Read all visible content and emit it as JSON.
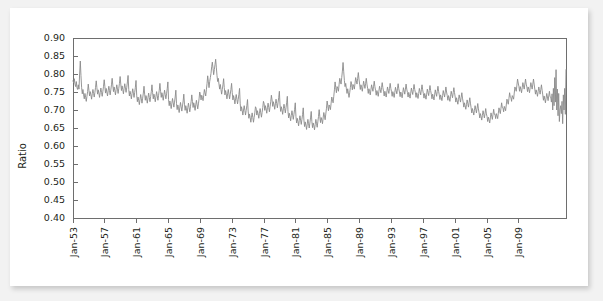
{
  "chart_data": {
    "type": "line",
    "title": "",
    "xlabel": "",
    "ylabel": "Ratio",
    "ylim": [
      0.4,
      0.9
    ],
    "ytick_labels": [
      "0.90",
      "0.85",
      "0.80",
      "0.75",
      "0.70",
      "0.65",
      "0.60",
      "0.55",
      "0.50",
      "0.45",
      "0.40"
    ],
    "ytick_values": [
      0.9,
      0.85,
      0.8,
      0.75,
      0.7,
      0.65,
      0.6,
      0.55,
      0.5,
      0.45,
      0.4
    ],
    "xtick_labels": [
      "Jan-53",
      "Jan-57",
      "Jan-61",
      "Jan-65",
      "Jan-69",
      "Jan-73",
      "Jan-77",
      "Jan-81",
      "Jan-85",
      "Jan-89",
      "Jan-93",
      "Jan-97",
      "Jan-01",
      "Jan-05",
      "Jan-09"
    ],
    "xtick_index": [
      0,
      48,
      96,
      144,
      192,
      240,
      288,
      336,
      384,
      432,
      480,
      528,
      576,
      624,
      672
    ],
    "x_start_label": "Jan-53",
    "x_end_label": "Jan-09",
    "grid": false,
    "legend": false,
    "series_name": "Ratio",
    "line_color": "#8a8a8a",
    "frame_color": "#6e6e6e",
    "background_color": "#ffffff",
    "page_background_color": "#f2f2f2",
    "n_points": 690,
    "values": [
      0.781,
      0.775,
      0.787,
      0.772,
      0.765,
      0.779,
      0.762,
      0.757,
      0.77,
      0.758,
      0.8,
      0.836,
      0.796,
      0.762,
      0.745,
      0.757,
      0.742,
      0.731,
      0.746,
      0.735,
      0.724,
      0.738,
      0.751,
      0.772,
      0.755,
      0.739,
      0.751,
      0.742,
      0.73,
      0.745,
      0.757,
      0.746,
      0.736,
      0.749,
      0.763,
      0.781,
      0.762,
      0.744,
      0.756,
      0.747,
      0.735,
      0.748,
      0.761,
      0.749,
      0.738,
      0.752,
      0.766,
      0.784,
      0.766,
      0.747,
      0.76,
      0.75,
      0.739,
      0.753,
      0.766,
      0.754,
      0.742,
      0.756,
      0.77,
      0.788,
      0.769,
      0.751,
      0.764,
      0.754,
      0.742,
      0.757,
      0.77,
      0.758,
      0.746,
      0.76,
      0.774,
      0.793,
      0.772,
      0.754,
      0.767,
      0.757,
      0.745,
      0.76,
      0.773,
      0.761,
      0.749,
      0.763,
      0.778,
      0.796,
      0.757,
      0.739,
      0.752,
      0.743,
      0.731,
      0.746,
      0.759,
      0.747,
      0.735,
      0.749,
      0.763,
      0.782,
      0.741,
      0.723,
      0.736,
      0.727,
      0.715,
      0.73,
      0.743,
      0.731,
      0.719,
      0.733,
      0.747,
      0.766,
      0.744,
      0.727,
      0.74,
      0.731,
      0.719,
      0.734,
      0.747,
      0.735,
      0.723,
      0.737,
      0.751,
      0.77,
      0.748,
      0.731,
      0.744,
      0.735,
      0.723,
      0.738,
      0.751,
      0.739,
      0.727,
      0.741,
      0.755,
      0.774,
      0.752,
      0.735,
      0.748,
      0.739,
      0.727,
      0.742,
      0.755,
      0.743,
      0.731,
      0.745,
      0.759,
      0.778,
      0.729,
      0.712,
      0.725,
      0.716,
      0.704,
      0.719,
      0.732,
      0.72,
      0.708,
      0.722,
      0.736,
      0.755,
      0.718,
      0.701,
      0.714,
      0.705,
      0.693,
      0.708,
      0.721,
      0.709,
      0.697,
      0.711,
      0.725,
      0.744,
      0.716,
      0.699,
      0.712,
      0.703,
      0.691,
      0.706,
      0.719,
      0.707,
      0.695,
      0.709,
      0.723,
      0.742,
      0.724,
      0.707,
      0.72,
      0.711,
      0.699,
      0.714,
      0.727,
      0.715,
      0.703,
      0.717,
      0.731,
      0.75,
      0.742,
      0.728,
      0.741,
      0.735,
      0.726,
      0.741,
      0.757,
      0.748,
      0.739,
      0.756,
      0.773,
      0.795,
      0.778,
      0.762,
      0.779,
      0.79,
      0.802,
      0.82,
      0.833,
      0.816,
      0.798,
      0.812,
      0.826,
      0.841,
      0.819,
      0.796,
      0.779,
      0.788,
      0.772,
      0.758,
      0.771,
      0.757,
      0.744,
      0.757,
      0.77,
      0.787,
      0.762,
      0.742,
      0.754,
      0.744,
      0.731,
      0.745,
      0.757,
      0.744,
      0.731,
      0.744,
      0.757,
      0.774,
      0.748,
      0.728,
      0.74,
      0.73,
      0.717,
      0.731,
      0.743,
      0.73,
      0.717,
      0.73,
      0.743,
      0.76,
      0.717,
      0.697,
      0.709,
      0.699,
      0.686,
      0.7,
      0.712,
      0.699,
      0.686,
      0.699,
      0.712,
      0.729,
      0.697,
      0.677,
      0.689,
      0.679,
      0.666,
      0.68,
      0.692,
      0.679,
      0.666,
      0.679,
      0.692,
      0.709,
      0.705,
      0.686,
      0.698,
      0.689,
      0.677,
      0.691,
      0.704,
      0.692,
      0.68,
      0.693,
      0.707,
      0.724,
      0.718,
      0.699,
      0.712,
      0.703,
      0.691,
      0.706,
      0.719,
      0.707,
      0.695,
      0.709,
      0.723,
      0.741,
      0.728,
      0.71,
      0.723,
      0.714,
      0.702,
      0.717,
      0.73,
      0.718,
      0.706,
      0.72,
      0.734,
      0.752,
      0.714,
      0.696,
      0.709,
      0.7,
      0.688,
      0.703,
      0.716,
      0.704,
      0.692,
      0.706,
      0.72,
      0.738,
      0.696,
      0.678,
      0.691,
      0.682,
      0.67,
      0.685,
      0.698,
      0.686,
      0.674,
      0.688,
      0.702,
      0.72,
      0.682,
      0.664,
      0.677,
      0.668,
      0.656,
      0.671,
      0.684,
      0.672,
      0.66,
      0.674,
      0.688,
      0.706,
      0.672,
      0.654,
      0.667,
      0.658,
      0.646,
      0.661,
      0.674,
      0.662,
      0.65,
      0.664,
      0.678,
      0.696,
      0.668,
      0.651,
      0.664,
      0.656,
      0.645,
      0.66,
      0.674,
      0.663,
      0.652,
      0.667,
      0.682,
      0.701,
      0.681,
      0.665,
      0.679,
      0.672,
      0.662,
      0.678,
      0.693,
      0.683,
      0.673,
      0.689,
      0.705,
      0.725,
      0.712,
      0.698,
      0.714,
      0.709,
      0.701,
      0.719,
      0.736,
      0.728,
      0.72,
      0.738,
      0.756,
      0.778,
      0.762,
      0.748,
      0.765,
      0.76,
      0.752,
      0.77,
      0.788,
      0.78,
      0.772,
      0.79,
      0.808,
      0.832,
      0.806,
      0.782,
      0.765,
      0.774,
      0.759,
      0.746,
      0.759,
      0.747,
      0.735,
      0.748,
      0.762,
      0.779,
      0.77,
      0.756,
      0.771,
      0.766,
      0.758,
      0.774,
      0.79,
      0.781,
      0.772,
      0.788,
      0.804,
      0.786,
      0.772,
      0.757,
      0.77,
      0.762,
      0.752,
      0.766,
      0.78,
      0.77,
      0.76,
      0.774,
      0.788,
      0.772,
      0.76,
      0.746,
      0.759,
      0.751,
      0.742,
      0.756,
      0.77,
      0.761,
      0.752,
      0.766,
      0.78,
      0.765,
      0.754,
      0.741,
      0.754,
      0.747,
      0.738,
      0.752,
      0.766,
      0.757,
      0.748,
      0.762,
      0.776,
      0.762,
      0.752,
      0.739,
      0.752,
      0.745,
      0.736,
      0.75,
      0.764,
      0.755,
      0.746,
      0.76,
      0.774,
      0.76,
      0.751,
      0.738,
      0.751,
      0.744,
      0.735,
      0.749,
      0.763,
      0.754,
      0.745,
      0.759,
      0.773,
      0.759,
      0.75,
      0.737,
      0.75,
      0.743,
      0.734,
      0.748,
      0.762,
      0.753,
      0.744,
      0.758,
      0.772,
      0.758,
      0.749,
      0.736,
      0.749,
      0.742,
      0.733,
      0.747,
      0.761,
      0.752,
      0.743,
      0.757,
      0.771,
      0.757,
      0.748,
      0.735,
      0.748,
      0.741,
      0.732,
      0.746,
      0.76,
      0.751,
      0.742,
      0.756,
      0.77,
      0.756,
      0.746,
      0.733,
      0.746,
      0.739,
      0.73,
      0.744,
      0.758,
      0.749,
      0.74,
      0.754,
      0.768,
      0.754,
      0.744,
      0.731,
      0.744,
      0.737,
      0.728,
      0.742,
      0.756,
      0.747,
      0.738,
      0.752,
      0.766,
      0.752,
      0.742,
      0.729,
      0.742,
      0.735,
      0.726,
      0.74,
      0.754,
      0.745,
      0.736,
      0.75,
      0.764,
      0.75,
      0.74,
      0.727,
      0.74,
      0.733,
      0.724,
      0.738,
      0.752,
      0.743,
      0.734,
      0.748,
      0.762,
      0.748,
      0.736,
      0.722,
      0.734,
      0.726,
      0.716,
      0.729,
      0.742,
      0.732,
      0.722,
      0.735,
      0.748,
      0.733,
      0.722,
      0.708,
      0.72,
      0.712,
      0.702,
      0.715,
      0.728,
      0.718,
      0.708,
      0.721,
      0.734,
      0.719,
      0.706,
      0.692,
      0.704,
      0.696,
      0.686,
      0.699,
      0.712,
      0.702,
      0.692,
      0.705,
      0.718,
      0.703,
      0.692,
      0.678,
      0.69,
      0.682,
      0.672,
      0.685,
      0.698,
      0.688,
      0.678,
      0.691,
      0.704,
      0.689,
      0.682,
      0.668,
      0.68,
      0.673,
      0.664,
      0.678,
      0.692,
      0.683,
      0.674,
      0.688,
      0.702,
      0.688,
      0.688,
      0.676,
      0.69,
      0.684,
      0.676,
      0.691,
      0.706,
      0.698,
      0.69,
      0.705,
      0.72,
      0.707,
      0.706,
      0.695,
      0.71,
      0.705,
      0.698,
      0.714,
      0.73,
      0.723,
      0.716,
      0.732,
      0.748,
      0.736,
      0.734,
      0.724,
      0.74,
      0.736,
      0.73,
      0.747,
      0.764,
      0.758,
      0.752,
      0.769,
      0.786,
      0.775,
      0.766,
      0.752,
      0.765,
      0.757,
      0.748,
      0.762,
      0.776,
      0.767,
      0.758,
      0.772,
      0.786,
      0.772,
      0.764,
      0.751,
      0.764,
      0.757,
      0.748,
      0.762,
      0.776,
      0.767,
      0.758,
      0.772,
      0.786,
      0.772,
      0.758,
      0.744,
      0.756,
      0.748,
      0.738,
      0.751,
      0.764,
      0.754,
      0.744,
      0.757,
      0.77,
      0.755,
      0.742,
      0.727,
      0.739,
      0.73,
      0.72,
      0.733,
      0.746,
      0.736,
      0.726,
      0.739,
      0.752,
      0.737,
      0.736,
      0.722,
      0.745,
      0.7,
      0.76,
      0.712,
      0.79,
      0.722,
      0.812,
      0.7,
      0.758,
      0.684,
      0.746,
      0.668,
      0.7,
      0.712,
      0.69,
      0.724,
      0.662,
      0.742,
      0.7,
      0.76,
      0.688,
      0.812
    ]
  }
}
